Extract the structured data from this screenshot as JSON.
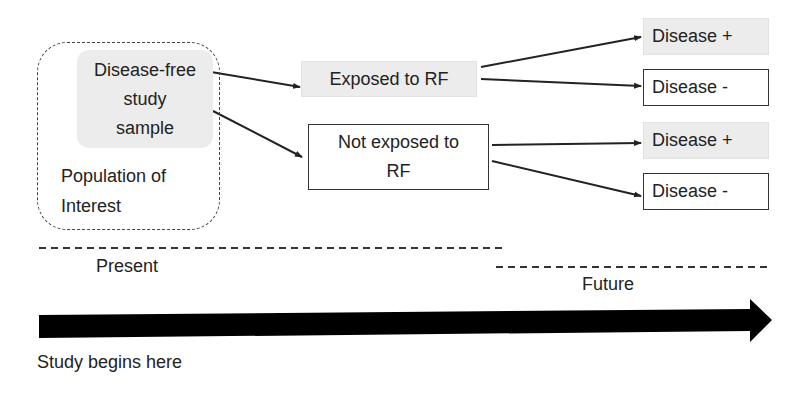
{
  "diagram": {
    "population_box": {
      "label_lines": [
        "Population of",
        "Interest"
      ]
    },
    "sample_box": {
      "label_lines": [
        "Disease-free",
        "study",
        "sample"
      ]
    },
    "exposure_groups": [
      {
        "label": "Exposed to RF",
        "fill": "#ececec"
      },
      {
        "label_lines": [
          "Not exposed to",
          "RF"
        ],
        "fill": "#ffffff"
      }
    ],
    "outcomes": [
      {
        "label": "Disease +",
        "group": "Exposed to RF",
        "fill": "#ececec"
      },
      {
        "label": "Disease -",
        "group": "Exposed to RF",
        "fill": "#ffffff"
      },
      {
        "label": "Disease +",
        "group": "Not exposed to RF",
        "fill": "#ececec"
      },
      {
        "label": "Disease -",
        "group": "Not exposed to RF",
        "fill": "#ffffff"
      }
    ],
    "timeline": {
      "present_label": "Present",
      "future_label": "Future",
      "start_label": "Study begins here"
    }
  },
  "colors": {
    "text": "#222222",
    "box_gray": "#ececec",
    "line": "#222222",
    "arrow": "#000000"
  }
}
